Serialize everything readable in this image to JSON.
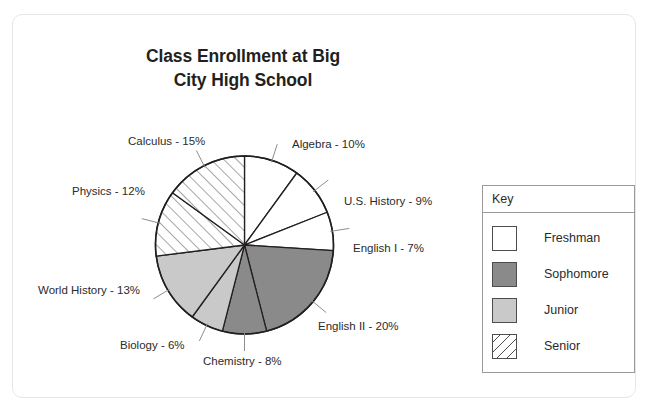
{
  "card": {
    "label": "chart-card"
  },
  "chart_data": {
    "type": "pie",
    "title_line1": "Class Enrollment at Big",
    "title_line2": "City High School",
    "title": "Class Enrollment at Big City High School",
    "xlabel": "",
    "ylabel": "",
    "legend_position": "right",
    "legend_title": "Key",
    "units": "percent",
    "start_angle_deg": 0,
    "direction": "clockwise",
    "categories": [
      "Algebra",
      "U.S. History",
      "English I",
      "English II",
      "Chemistry",
      "Biology",
      "World History",
      "Physics",
      "Calculus"
    ],
    "values": [
      10,
      9,
      7,
      20,
      8,
      6,
      13,
      12,
      15
    ],
    "groups": [
      "Freshman",
      "Freshman",
      "Freshman",
      "Sophomore",
      "Sophomore",
      "Junior",
      "Junior",
      "Senior",
      "Senior"
    ],
    "slices": [
      {
        "name": "Algebra",
        "value": 10,
        "label": "Algebra - 10%",
        "group": "Freshman",
        "fill": "#ffffff"
      },
      {
        "name": "U.S. History",
        "value": 9,
        "label": "U.S. History - 9%",
        "group": "Freshman",
        "fill": "#ffffff"
      },
      {
        "name": "English I",
        "value": 7,
        "label": "English I - 7%",
        "group": "Freshman",
        "fill": "#ffffff"
      },
      {
        "name": "English II",
        "value": 20,
        "label": "English II - 20%",
        "group": "Sophomore",
        "fill": "#8a8a8a"
      },
      {
        "name": "Chemistry",
        "value": 8,
        "label": "Chemistry - 8%",
        "group": "Sophomore",
        "fill": "#8a8a8a"
      },
      {
        "name": "Biology",
        "value": 6,
        "label": "Biology - 6%",
        "group": "Junior",
        "fill": "#c9c9c9"
      },
      {
        "name": "World History",
        "value": 13,
        "label": "World History - 13%",
        "group": "Junior",
        "fill": "#c9c9c9"
      },
      {
        "name": "Physics",
        "value": 12,
        "label": "Physics - 12%",
        "group": "Senior",
        "fill": "hatch"
      },
      {
        "name": "Calculus",
        "value": 15,
        "label": "Calculus - 15%",
        "group": "Senior",
        "fill": "hatch"
      }
    ]
  },
  "legend": {
    "title": "Key",
    "items": [
      {
        "label": "Freshman",
        "fill": "#ffffff"
      },
      {
        "label": "Sophomore",
        "fill": "#8a8a8a"
      },
      {
        "label": "Junior",
        "fill": "#c9c9c9"
      },
      {
        "label": "Senior",
        "fill": "hatch"
      }
    ]
  },
  "colors": {
    "freshman": "#ffffff",
    "sophomore": "#8a8a8a",
    "junior": "#c9c9c9",
    "senior_hatch_line": "#4d4d4d",
    "outline": "#231f20",
    "text": "#2b2b2b"
  }
}
